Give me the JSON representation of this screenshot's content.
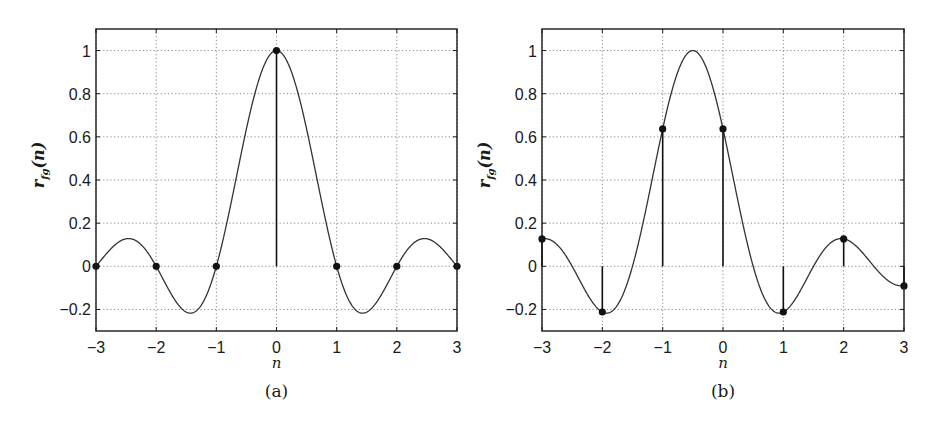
{
  "chart_data": [
    {
      "type": "line",
      "panel": "(a)",
      "caption": "(a)",
      "xlabel": "n",
      "ylabel": "r_fg(n)",
      "ylabel_main": "r",
      "ylabel_sub": "fg",
      "ylabel_arg": "(n)",
      "xlim": [
        -3,
        3
      ],
      "ylim": [
        -0.3,
        1.1
      ],
      "grid": true,
      "x_ticks": [
        "-3",
        "-2",
        "-1",
        "0",
        "1",
        "2",
        "3"
      ],
      "y_ticks": [
        "-0.2",
        "0",
        "0.2",
        "0.4",
        "0.6",
        "0.8",
        "1"
      ],
      "curve": {
        "function": "sinc(n)",
        "shift": 0
      },
      "stems": {
        "x": [
          -3,
          -2,
          -1,
          0,
          1,
          2,
          3
        ],
        "values": [
          0,
          0,
          0,
          1,
          0,
          0,
          0
        ]
      }
    },
    {
      "type": "line",
      "panel": "(b)",
      "caption": "(b)",
      "xlabel": "n",
      "ylabel": "r_fg(n)",
      "ylabel_main": "r",
      "ylabel_sub": "fg",
      "ylabel_arg": "(n)",
      "xlim": [
        -3,
        3
      ],
      "ylim": [
        -0.3,
        1.1
      ],
      "grid": true,
      "x_ticks": [
        "-3",
        "-2",
        "-1",
        "0",
        "1",
        "2",
        "3"
      ],
      "y_ticks": [
        "-0.2",
        "0",
        "0.2",
        "0.4",
        "0.6",
        "0.8",
        "1"
      ],
      "curve": {
        "function": "sinc(n+0.5)",
        "shift": 0.5
      },
      "stems": {
        "x": [
          -3,
          -2,
          -1,
          0,
          1,
          2,
          3
        ],
        "values": [
          0.127,
          -0.212,
          0.637,
          0.637,
          -0.212,
          0.127,
          -0.091
        ]
      }
    }
  ],
  "colors": {
    "curve": "#333333",
    "axes": "#1a1a1a",
    "grid": "#888888",
    "marker": "#111111"
  }
}
